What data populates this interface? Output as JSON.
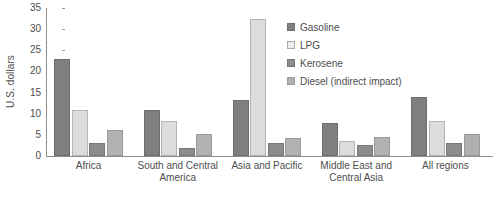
{
  "chart_data": {
    "type": "bar",
    "title": "",
    "subtitle": "",
    "xlabel": "",
    "ylabel": "U.S. dollars",
    "ylim": [
      0,
      35
    ],
    "ytick_step": 5,
    "yticks": [
      "0",
      "5",
      "10",
      "15",
      "20",
      "25",
      "30",
      "35"
    ],
    "grid": false,
    "legend_position": "top-right-inside",
    "categories": [
      "Africa",
      "South and Central America",
      "Asia and Pacific",
      "Middle East and Central Asia",
      "All regions"
    ],
    "series": [
      {
        "name": "Gasoline",
        "color": "#7f7f7f",
        "values": [
          23.0,
          11.0,
          13.3,
          7.7,
          14.0
        ]
      },
      {
        "name": "LPG",
        "color": "#dcdcdc",
        "values": [
          11.0,
          8.3,
          32.5,
          3.5,
          8.3
        ]
      },
      {
        "name": "Kerosene",
        "color": "#8c8c8c",
        "values": [
          3.0,
          2.0,
          3.0,
          2.5,
          3.0
        ]
      },
      {
        "name": "Diesel (indirect impact)",
        "color": "#b1b1b1",
        "values": [
          6.2,
          5.2,
          4.2,
          4.5,
          5.3
        ]
      }
    ]
  },
  "caption": {
    "text": ""
  }
}
